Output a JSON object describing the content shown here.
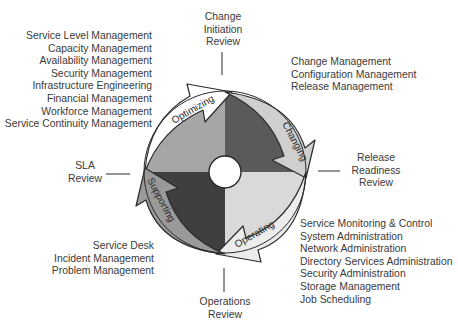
{
  "diagram": {
    "title": "",
    "center": {
      "x": 225,
      "y": 172,
      "radius": 81,
      "hole_radius": 16
    },
    "colors": {
      "optimizing_quadrant": "#a6a6a6",
      "changing_quadrant": "#5a5a5a",
      "operating_quadrant": "#d9d9d9",
      "supporting_quadrant": "#3f3f3f",
      "optimizing_arrow": "#ffffff",
      "changing_arrow": "#cfcfcf",
      "operating_arrow": "#ececec",
      "supporting_arrow": "#9a9a9a",
      "outline": "#2a2a2a",
      "text": "#3a3a3a"
    },
    "phases": [
      {
        "id": "optimizing",
        "label": "Optimizing"
      },
      {
        "id": "changing",
        "label": "Changing"
      },
      {
        "id": "operating",
        "label": "Operating"
      },
      {
        "id": "supporting",
        "label": "Supporting"
      }
    ],
    "reviews": {
      "change_initiation": [
        "Change",
        "Initiation",
        "Review"
      ],
      "release_readiness": [
        "Release",
        "Readiness",
        "Review"
      ],
      "operations": [
        "Operations",
        "Review"
      ],
      "sla": [
        "SLA",
        "Review"
      ]
    },
    "functions": {
      "optimizing": [
        "Service Level Management",
        "Capacity Management",
        "Availability Management",
        "Security Management",
        "Infrastructure Engineering",
        "Financial Management",
        "Workforce Management",
        "Service Continuity Management"
      ],
      "changing": [
        "Change Management",
        "Configuration Management",
        "Release Management"
      ],
      "operating": [
        "Service Monitoring & Control",
        "System Administration",
        "Network Administration",
        "Directory Services Administration",
        "Security Administration",
        "Storage Management",
        "Job Scheduling"
      ],
      "supporting": [
        "Service Desk",
        "Incident Management",
        "Problem Management"
      ]
    }
  }
}
